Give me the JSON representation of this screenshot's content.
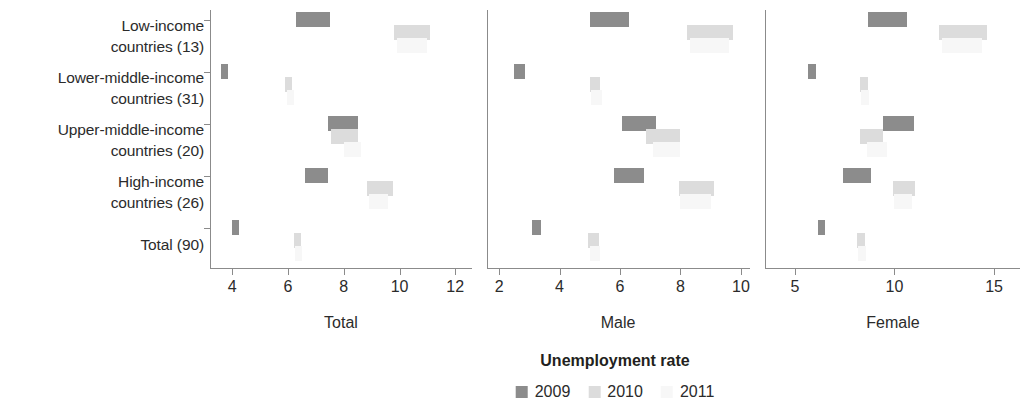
{
  "chart_data": {
    "type": "bar",
    "title": "",
    "xlabel": "Unemployment rate",
    "ylabel": "",
    "grid": false,
    "legend_position": "bottom",
    "legend": [
      {
        "name": "2009",
        "color": "#8c8c8c"
      },
      {
        "name": "2010",
        "color": "#dcdcdc"
      },
      {
        "name": "2011",
        "color": "#f7f7f7"
      }
    ],
    "categories": [
      "Low-income\ncountries (13)",
      "Lower-middle-income\ncountries (31)",
      "Upper-middle-income\ncountries (20)",
      "High-income\ncountries (26)",
      "Total (90)"
    ],
    "panels": [
      {
        "name": "Total",
        "xlim": [
          3.2,
          12.6
        ],
        "ticks": [
          4,
          6,
          8,
          10,
          12
        ],
        "tick_labels": [
          "4",
          "6",
          "8",
          "10",
          "12"
        ],
        "series": [
          {
            "name": "2009",
            "color": "#8c8c8c",
            "bars": [
              {
                "category": "Low-income countries (13)",
                "start": 6.3,
                "end": 7.5
              },
              {
                "category": "Lower-middle-income countries (31)",
                "start": 3.6,
                "end": 3.85
              },
              {
                "category": "Upper-middle-income countries (20)",
                "start": 7.45,
                "end": 8.5
              },
              {
                "category": "High-income countries (26)",
                "start": 6.6,
                "end": 7.45
              },
              {
                "category": "Total (90)",
                "start": 4.0,
                "end": 4.25
              }
            ]
          },
          {
            "name": "2010",
            "color": "#dcdcdc",
            "bars": [
              {
                "category": "Low-income countries (13)",
                "start": 9.8,
                "end": 11.1
              },
              {
                "category": "Lower-middle-income countries (31)",
                "start": 5.9,
                "end": 6.15
              },
              {
                "category": "Upper-middle-income countries (20)",
                "start": 7.55,
                "end": 8.5
              },
              {
                "category": "High-income countries (26)",
                "start": 8.85,
                "end": 9.75
              },
              {
                "category": "Total (90)",
                "start": 6.2,
                "end": 6.45
              }
            ]
          },
          {
            "name": "2011",
            "color": "#f7f7f7",
            "bars": [
              {
                "category": "Low-income countries (13)",
                "start": 9.9,
                "end": 11.0
              },
              {
                "category": "Lower-middle-income countries (31)",
                "start": 5.95,
                "end": 6.2
              },
              {
                "category": "Upper-middle-income countries (20)",
                "start": 8.0,
                "end": 8.6
              },
              {
                "category": "High-income countries (26)",
                "start": 8.9,
                "end": 9.6
              },
              {
                "category": "Total (90)",
                "start": 6.25,
                "end": 6.5
              }
            ]
          }
        ]
      },
      {
        "name": "Male",
        "xlim": [
          1.6,
          10.3
        ],
        "ticks": [
          2,
          4,
          6,
          8,
          10
        ],
        "tick_labels": [
          "2",
          "4",
          "6",
          "8",
          "10"
        ],
        "series": [
          {
            "name": "2009",
            "color": "#8c8c8c",
            "bars": [
              {
                "category": "Low-income countries (13)",
                "start": 5.0,
                "end": 6.3
              },
              {
                "category": "Lower-middle-income countries (31)",
                "start": 2.5,
                "end": 2.85
              },
              {
                "category": "Upper-middle-income countries (20)",
                "start": 6.05,
                "end": 7.2
              },
              {
                "category": "High-income countries (26)",
                "start": 5.8,
                "end": 6.8
              },
              {
                "category": "Total (90)",
                "start": 3.1,
                "end": 3.4
              }
            ]
          },
          {
            "name": "2010",
            "color": "#dcdcdc",
            "bars": [
              {
                "category": "Low-income countries (13)",
                "start": 8.2,
                "end": 9.75
              },
              {
                "category": "Lower-middle-income countries (31)",
                "start": 5.0,
                "end": 5.35
              },
              {
                "category": "Upper-middle-income countries (20)",
                "start": 6.85,
                "end": 8.0
              },
              {
                "category": "High-income countries (26)",
                "start": 7.95,
                "end": 9.1
              },
              {
                "category": "Total (90)",
                "start": 4.95,
                "end": 5.3
              }
            ]
          },
          {
            "name": "2011",
            "color": "#f7f7f7",
            "bars": [
              {
                "category": "Low-income countries (13)",
                "start": 8.3,
                "end": 9.6
              },
              {
                "category": "Lower-middle-income countries (31)",
                "start": 5.05,
                "end": 5.4
              },
              {
                "category": "Upper-middle-income countries (20)",
                "start": 7.1,
                "end": 8.0
              },
              {
                "category": "High-income countries (26)",
                "start": 8.0,
                "end": 9.0
              },
              {
                "category": "Total (90)",
                "start": 5.0,
                "end": 5.35
              }
            ]
          }
        ]
      },
      {
        "name": "Female",
        "xlim": [
          3.5,
          16.3
        ],
        "ticks": [
          5,
          10,
          15
        ],
        "tick_labels": [
          "5",
          "10",
          "15"
        ],
        "series": [
          {
            "name": "2009",
            "color": "#8c8c8c",
            "bars": [
              {
                "category": "Low-income countries (13)",
                "start": 8.65,
                "end": 10.65
              },
              {
                "category": "Lower-middle-income countries (31)",
                "start": 5.65,
                "end": 6.05
              },
              {
                "category": "Upper-middle-income countries (20)",
                "start": 9.4,
                "end": 11.0
              },
              {
                "category": "High-income countries (26)",
                "start": 7.4,
                "end": 8.8
              },
              {
                "category": "Total (90)",
                "start": 6.15,
                "end": 6.5
              }
            ]
          },
          {
            "name": "2010",
            "color": "#dcdcdc",
            "bars": [
              {
                "category": "Low-income countries (13)",
                "start": 12.25,
                "end": 14.65
              },
              {
                "category": "Lower-middle-income countries (31)",
                "start": 8.25,
                "end": 8.65
              },
              {
                "category": "Upper-middle-income countries (20)",
                "start": 8.25,
                "end": 9.4
              },
              {
                "category": "High-income countries (26)",
                "start": 9.9,
                "end": 11.05
              },
              {
                "category": "Total (90)",
                "start": 8.1,
                "end": 8.5
              }
            ]
          },
          {
            "name": "2011",
            "color": "#f7f7f7",
            "bars": [
              {
                "category": "Low-income countries (13)",
                "start": 12.4,
                "end": 14.4
              },
              {
                "category": "Lower-middle-income countries (31)",
                "start": 8.3,
                "end": 8.7
              },
              {
                "category": "Upper-middle-income countries (20)",
                "start": 8.6,
                "end": 9.6
              },
              {
                "category": "High-income countries (26)",
                "start": 10.0,
                "end": 10.9
              },
              {
                "category": "Total (90)",
                "start": 8.15,
                "end": 8.55
              }
            ]
          }
        ]
      }
    ]
  }
}
